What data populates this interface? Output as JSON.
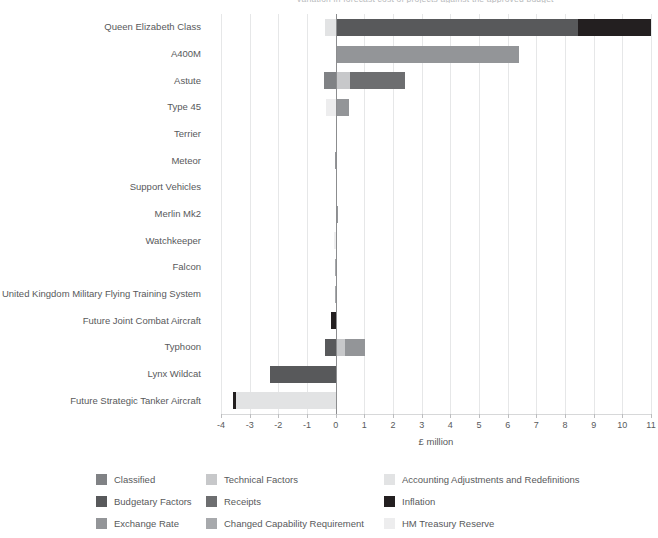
{
  "chart_data": {
    "type": "bar",
    "orientation": "horizontal",
    "stacked": true,
    "title": "Variation in forecast cost of projects against the approved budget",
    "xlabel": "£ million",
    "ylabel": "",
    "xlim": [
      -4,
      11
    ],
    "xticks": [
      -4,
      -3,
      -2,
      -1,
      0,
      1,
      2,
      3,
      4,
      5,
      6,
      7,
      8,
      9,
      10,
      11
    ],
    "xticklabels": [
      "-4",
      "-3",
      "-2",
      "-1",
      "0",
      "1",
      "2",
      "3",
      "4",
      "5",
      "6",
      "7",
      "8",
      "9",
      "10",
      "11"
    ],
    "grid": "vertical",
    "legend_position": "bottom",
    "categories": [
      "Queen Elizabeth Class",
      "A400M",
      "Astute",
      "Type 45",
      "Terrier",
      "Meteor",
      "Support Vehicles",
      "Merlin Mk2",
      "Watchkeeper",
      "Falcon",
      "United Kingdom Military Flying Training System",
      "Future Joint Combat Aircraft",
      "Typhoon",
      "Lynx Wildcat",
      "Future Strategic Tanker Aircraft"
    ],
    "series": [
      {
        "name": "Classified",
        "color": "#808285",
        "values": [
          0,
          0,
          -0.42,
          0,
          0,
          0,
          0,
          0,
          0,
          0,
          0,
          0,
          0,
          0,
          0
        ]
      },
      {
        "name": "Technical Factors",
        "color": "#c7c8ca",
        "values": [
          0,
          0,
          0.5,
          0,
          0,
          0,
          0,
          0,
          0,
          0,
          0,
          0,
          0.33,
          0,
          0
        ]
      },
      {
        "name": "Accounting Adjustments and Redefinitions",
        "color": "#e2e3e4",
        "values": [
          -0.38,
          0,
          0,
          0,
          0,
          0,
          0,
          0,
          0,
          0,
          0,
          0,
          0,
          0,
          -3.48
        ]
      },
      {
        "name": "Budgetary Factors",
        "color": "#58595b",
        "values": [
          8.45,
          0,
          0,
          0,
          0,
          0,
          0,
          0,
          0,
          0,
          0,
          0,
          -0.38,
          -2.3,
          0
        ]
      },
      {
        "name": "Receipts",
        "color": "#6d6e70",
        "values": [
          0,
          0,
          1.92,
          0,
          0,
          0,
          0,
          0,
          0,
          0,
          0,
          0,
          0,
          0,
          0
        ]
      },
      {
        "name": "Inflation",
        "color": "#231f20",
        "values": [
          2.55,
          0,
          0,
          0,
          0,
          0,
          0,
          0,
          0,
          0,
          0,
          -0.17,
          0,
          0,
          -0.1
        ]
      },
      {
        "name": "Exchange Rate",
        "color": "#939598",
        "values": [
          0,
          6.4,
          0,
          0.45,
          0.06,
          -0.02,
          0,
          0.07,
          0,
          0,
          0,
          0,
          0.7,
          0,
          0
        ]
      },
      {
        "name": "Changed Capability Requirement",
        "color": "#a7a9ac",
        "values": [
          0,
          0,
          0,
          0,
          0,
          0,
          0,
          0,
          0,
          -0.04,
          -0.02,
          0,
          0,
          0,
          0
        ]
      },
      {
        "name": "HM Treasury Reserve",
        "color": "#ededee",
        "values": [
          0,
          0,
          0,
          -0.33,
          0,
          0,
          0,
          0,
          -0.05,
          0,
          0,
          0,
          0,
          0,
          0
        ]
      }
    ]
  },
  "legend": {
    "items": [
      {
        "label": "Classified",
        "color": "#808285"
      },
      {
        "label": "Technical Factors",
        "color": "#c7c8ca"
      },
      {
        "label": "Accounting Adjustments and Redefinitions",
        "color": "#e2e3e4"
      },
      {
        "label": "Budgetary Factors",
        "color": "#58595b"
      },
      {
        "label": "Receipts",
        "color": "#6d6e70"
      },
      {
        "label": "Inflation",
        "color": "#231f20"
      },
      {
        "label": "Exchange Rate",
        "color": "#939598"
      },
      {
        "label": "Changed Capability Requirement",
        "color": "#a7a9ac"
      },
      {
        "label": "HM Treasury Reserve",
        "color": "#ededee"
      }
    ]
  }
}
